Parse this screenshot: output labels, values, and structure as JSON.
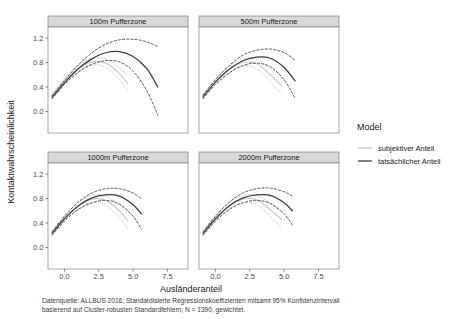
{
  "figure": {
    "width": 459,
    "height": 319,
    "background": "#ffffff"
  },
  "chart_data": {
    "type": "line",
    "title": "",
    "xlabel": "Ausländeranteil",
    "ylabel": "Kontaktwahrscheinlichkeit",
    "xlim": [
      -1.2,
      9.0
    ],
    "ylim": [
      -0.35,
      1.38
    ],
    "xticks": [
      "0.0",
      "2.5",
      "5.0",
      "7.5"
    ],
    "xtick_values": [
      0.0,
      2.5,
      5.0,
      7.5
    ],
    "yticks": [
      "0.0",
      "0.4",
      "0.8",
      "1.2"
    ],
    "ytick_values": [
      0.0,
      0.4,
      0.8,
      1.2
    ],
    "grid": false,
    "legend_position": "right",
    "legend_title": "Model",
    "facet_layout": "2x2",
    "series": [
      {
        "name": "subjektiver Anteil",
        "color": "#c8c8c8",
        "linestyle": "solid",
        "has_confidence_band": true
      },
      {
        "name": "tatsächlicher Anteil",
        "color": "#3d3d3d",
        "linestyle": "solid",
        "has_confidence_band": true
      }
    ],
    "panels": [
      {
        "label": "100m Pufferzone",
        "row": 0,
        "col": 0,
        "curves": {
          "subjektiver_fit": {
            "x": [
              -0.9,
              0.0,
              1.0,
              2.0,
              3.0,
              4.0,
              4.6
            ],
            "y": [
              0.26,
              0.5,
              0.7,
              0.81,
              0.79,
              0.62,
              0.46
            ]
          },
          "subjektiver_lower": {
            "x": [
              -0.9,
              0.0,
              1.0,
              2.0,
              3.0,
              4.0,
              4.6
            ],
            "y": [
              0.22,
              0.46,
              0.66,
              0.76,
              0.72,
              0.52,
              0.34
            ]
          },
          "subjektiver_upper": {
            "x": [
              -0.9,
              0.0,
              1.0,
              2.0,
              3.0,
              4.0,
              4.6
            ],
            "y": [
              0.3,
              0.54,
              0.75,
              0.87,
              0.86,
              0.72,
              0.58
            ]
          },
          "tatsaechlicher_fit": {
            "x": [
              -0.9,
              0.0,
              1.0,
              2.0,
              3.0,
              4.0,
              5.0,
              6.0,
              6.8
            ],
            "y": [
              0.23,
              0.47,
              0.7,
              0.86,
              0.96,
              0.98,
              0.9,
              0.7,
              0.4
            ]
          },
          "tatsaechlicher_lower": {
            "x": [
              -0.9,
              0.0,
              1.0,
              2.0,
              3.0,
              4.0,
              5.0,
              6.0,
              6.8
            ],
            "y": [
              0.21,
              0.44,
              0.64,
              0.77,
              0.83,
              0.81,
              0.66,
              0.34,
              -0.06
            ]
          },
          "tatsaechlicher_upper": {
            "x": [
              -0.9,
              0.0,
              1.0,
              2.0,
              3.0,
              4.0,
              5.0,
              6.0,
              6.8
            ],
            "y": [
              0.26,
              0.51,
              0.76,
              0.96,
              1.1,
              1.17,
              1.18,
              1.14,
              1.06
            ]
          }
        }
      },
      {
        "label": "500m Pufferzone",
        "row": 0,
        "col": 1,
        "curves": {
          "subjektiver_fit": {
            "x": [
              -0.9,
              0.0,
              1.0,
              2.0,
              3.0,
              4.0,
              4.8
            ],
            "y": [
              0.25,
              0.49,
              0.69,
              0.8,
              0.78,
              0.6,
              0.42
            ]
          },
          "subjektiver_lower": {
            "x": [
              -0.9,
              0.0,
              1.0,
              2.0,
              3.0,
              4.0,
              4.8
            ],
            "y": [
              0.21,
              0.45,
              0.64,
              0.74,
              0.7,
              0.49,
              0.29
            ]
          },
          "subjektiver_upper": {
            "x": [
              -0.9,
              0.0,
              1.0,
              2.0,
              3.0,
              4.0,
              4.8
            ],
            "y": [
              0.29,
              0.53,
              0.74,
              0.86,
              0.85,
              0.7,
              0.55
            ]
          },
          "tatsaechlicher_fit": {
            "x": [
              -0.9,
              0.0,
              1.0,
              2.0,
              3.0,
              4.0,
              5.0,
              5.8
            ],
            "y": [
              0.24,
              0.48,
              0.69,
              0.83,
              0.89,
              0.87,
              0.72,
              0.5
            ]
          },
          "tatsaechlicher_lower": {
            "x": [
              -0.9,
              0.0,
              1.0,
              2.0,
              3.0,
              4.0,
              5.0,
              5.8
            ],
            "y": [
              0.21,
              0.44,
              0.63,
              0.75,
              0.79,
              0.73,
              0.52,
              0.22
            ]
          },
          "tatsaechlicher_upper": {
            "x": [
              -0.9,
              0.0,
              1.0,
              2.0,
              3.0,
              4.0,
              5.0,
              5.8
            ],
            "y": [
              0.27,
              0.52,
              0.75,
              0.92,
              1.0,
              1.02,
              0.96,
              0.84
            ]
          }
        }
      },
      {
        "label": "1000m Pufferzone",
        "row": 1,
        "col": 0,
        "curves": {
          "subjektiver_fit": {
            "x": [
              -0.9,
              0.0,
              1.0,
              2.0,
              3.0,
              4.0,
              4.6
            ],
            "y": [
              0.24,
              0.48,
              0.68,
              0.79,
              0.77,
              0.6,
              0.44
            ]
          },
          "subjektiver_lower": {
            "x": [
              -0.9,
              0.0,
              1.0,
              2.0,
              3.0,
              4.0,
              4.6
            ],
            "y": [
              0.2,
              0.44,
              0.63,
              0.73,
              0.69,
              0.49,
              0.31
            ]
          },
          "subjektiver_upper": {
            "x": [
              -0.9,
              0.0,
              1.0,
              2.0,
              3.0,
              4.0,
              4.6
            ],
            "y": [
              0.28,
              0.52,
              0.73,
              0.85,
              0.84,
              0.7,
              0.56
            ]
          },
          "tatsaechlicher_fit": {
            "x": [
              -0.9,
              0.0,
              1.0,
              2.0,
              3.0,
              4.0,
              5.0,
              5.6
            ],
            "y": [
              0.23,
              0.47,
              0.68,
              0.81,
              0.86,
              0.84,
              0.7,
              0.55
            ]
          },
          "tatsaechlicher_lower": {
            "x": [
              -0.9,
              0.0,
              1.0,
              2.0,
              3.0,
              4.0,
              5.0,
              5.6
            ],
            "y": [
              0.2,
              0.43,
              0.62,
              0.73,
              0.77,
              0.71,
              0.51,
              0.3
            ]
          },
          "tatsaechlicher_upper": {
            "x": [
              -0.9,
              0.0,
              1.0,
              2.0,
              3.0,
              4.0,
              5.0,
              5.6
            ],
            "y": [
              0.26,
              0.51,
              0.74,
              0.89,
              0.96,
              0.96,
              0.89,
              0.8
            ]
          }
        }
      },
      {
        "label": "2000m Pufferzone",
        "row": 1,
        "col": 1,
        "curves": {
          "subjektiver_fit": {
            "x": [
              -0.9,
              0.0,
              1.0,
              2.0,
              3.0,
              4.0,
              4.8
            ],
            "y": [
              0.24,
              0.48,
              0.68,
              0.79,
              0.78,
              0.62,
              0.46
            ]
          },
          "subjektiver_lower": {
            "x": [
              -0.9,
              0.0,
              1.0,
              2.0,
              3.0,
              4.0,
              4.8
            ],
            "y": [
              0.2,
              0.44,
              0.63,
              0.73,
              0.7,
              0.51,
              0.33
            ]
          },
          "subjektiver_upper": {
            "x": [
              -0.9,
              0.0,
              1.0,
              2.0,
              3.0,
              4.0,
              4.8
            ],
            "y": [
              0.28,
              0.52,
              0.73,
              0.85,
              0.85,
              0.72,
              0.58
            ]
          },
          "tatsaechlicher_fit": {
            "x": [
              -0.9,
              0.0,
              1.0,
              2.0,
              3.0,
              4.0,
              5.0,
              5.6
            ],
            "y": [
              0.23,
              0.47,
              0.68,
              0.81,
              0.86,
              0.85,
              0.73,
              0.6
            ]
          },
          "tatsaechlicher_lower": {
            "x": [
              -0.9,
              0.0,
              1.0,
              2.0,
              3.0,
              4.0,
              5.0,
              5.6
            ],
            "y": [
              0.2,
              0.43,
              0.62,
              0.73,
              0.77,
              0.72,
              0.55,
              0.37
            ]
          },
          "tatsaechlicher_upper": {
            "x": [
              -0.9,
              0.0,
              1.0,
              2.0,
              3.0,
              4.0,
              5.0,
              5.6
            ],
            "y": [
              0.26,
              0.51,
              0.74,
              0.89,
              0.96,
              0.97,
              0.91,
              0.84
            ]
          }
        }
      }
    ]
  },
  "legend": {
    "title": "Model",
    "entries": [
      {
        "label": "subjektiver Anteil",
        "color": "#c8c8c8"
      },
      {
        "label": "tatsächlicher Anteil",
        "color": "#3d3d3d"
      }
    ]
  },
  "caption": {
    "line1": "Datenquelle: ALLBUS 2016; Standardisierte Regressionskoeffizienten mitsamt 95% Konfidenzintervall",
    "line2": "basierend auf Cluster-robusten Standardfehlern; N = 1390, gewichtet."
  },
  "style": {
    "panel_border": "#808080",
    "strip_background": "#d9d9d9",
    "tick_color": "#4d4d4d",
    "text_color": "#1a1a1a"
  }
}
